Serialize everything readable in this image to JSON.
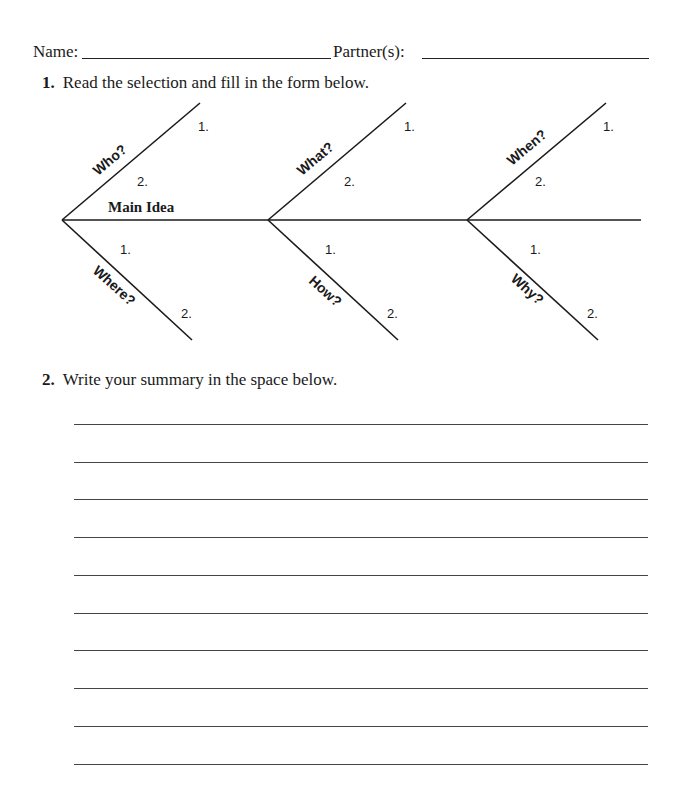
{
  "header": {
    "name_label": "Name:",
    "partner_label": "Partner(s):"
  },
  "question1": {
    "number": "1.",
    "text": "Read the selection and fill in the form below."
  },
  "diagram": {
    "main_label": "Main Idea",
    "segments": [
      {
        "upper": "Who?",
        "lower": "Where?"
      },
      {
        "upper": "What?",
        "lower": "How?"
      },
      {
        "upper": "When?",
        "lower": "Why?"
      }
    ],
    "numbers": {
      "one": "1.",
      "two": "2."
    }
  },
  "question2": {
    "number": "2.",
    "text": "Write your summary in the space below.",
    "line_count": 10
  }
}
